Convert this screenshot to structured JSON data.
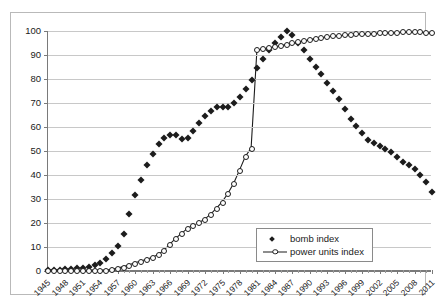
{
  "chart_data": {
    "type": "scatter",
    "title": "",
    "xlabel": "",
    "ylabel": "",
    "ylim": [
      0,
      100
    ],
    "ytick_step": 10,
    "yticks": [
      0,
      10,
      20,
      30,
      40,
      50,
      60,
      70,
      80,
      90,
      100
    ],
    "grid": true,
    "legend_position": "inside-bottom-right",
    "x": [
      1945,
      1946,
      1947,
      1948,
      1949,
      1950,
      1951,
      1952,
      1953,
      1954,
      1955,
      1956,
      1957,
      1958,
      1959,
      1960,
      1961,
      1962,
      1963,
      1964,
      1965,
      1966,
      1967,
      1968,
      1969,
      1970,
      1971,
      1972,
      1973,
      1974,
      1975,
      1976,
      1977,
      1978,
      1979,
      1980,
      1981,
      1982,
      1983,
      1984,
      1985,
      1986,
      1987,
      1988,
      1989,
      1990,
      1991,
      1992,
      1993,
      1994,
      1995,
      1996,
      1997,
      1998,
      1999,
      2000,
      2001,
      2002,
      2003,
      2004,
      2005,
      2006,
      2007,
      2008,
      2009,
      2010,
      2011
    ],
    "xtick_labels": [
      "1945",
      "1948",
      "1951",
      "1954",
      "1957",
      "1960",
      "1963",
      "1966",
      "1969",
      "1972",
      "1975",
      "1978",
      "1981",
      "1984",
      "1987",
      "1990",
      "1993",
      "1996",
      "1999",
      "2002",
      "2005",
      "2008",
      "2011"
    ],
    "series": [
      {
        "name": "bomb index",
        "marker": "filled-diamond",
        "color": "#1c1c1c",
        "line": false,
        "values": [
          0.4,
          0.5,
          0.6,
          0.7,
          0.9,
          1.1,
          1.4,
          1.8,
          2.6,
          3.4,
          5.0,
          7.5,
          10.6,
          15.5,
          23.8,
          31.8,
          38.0,
          44.3,
          48.8,
          52.8,
          55.5,
          56.8,
          56.8,
          55.0,
          55.5,
          58.3,
          61.7,
          64.5,
          66.8,
          68.3,
          68.5,
          68.3,
          70.2,
          72.5,
          76.0,
          79.6,
          84.5,
          88.4,
          92.0,
          95.0,
          97.5,
          100.0,
          98.5,
          95.0,
          92.0,
          88.5,
          85.0,
          82.0,
          78.5,
          75.0,
          71.5,
          67.5,
          63.5,
          60.5,
          57.5,
          54.5,
          53.5,
          52.0,
          51.0,
          49.5,
          47.5,
          45.5,
          44.0,
          42.3,
          40.0,
          37.0,
          33.0
        ]
      },
      {
        "name": "power units index",
        "marker": "open-circle",
        "color": "#1c1c1c",
        "line": true,
        "values": [
          0,
          0,
          0,
          0,
          0,
          0,
          0,
          0,
          0,
          0,
          0,
          0.3,
          0.8,
          1.4,
          2.2,
          3.0,
          3.8,
          4.5,
          5.3,
          6.5,
          8.3,
          10.8,
          13.2,
          15.3,
          17.3,
          18.8,
          19.8,
          21.3,
          23.3,
          25.8,
          28.5,
          32.0,
          36.3,
          41.8,
          47.5,
          51.0,
          92.0,
          92.5,
          93.0,
          93.3,
          93.8,
          94.3,
          94.8,
          95.3,
          95.8,
          96.3,
          96.8,
          97.2,
          97.5,
          97.8,
          98.0,
          98.2,
          98.4,
          98.6,
          98.7,
          98.8,
          98.9,
          99.0,
          99.1,
          99.2,
          99.3,
          99.4,
          99.4,
          99.5,
          99.5,
          99.3,
          99.0
        ]
      }
    ]
  },
  "legend": {
    "entries": [
      {
        "label": "bomb index"
      },
      {
        "label": "power units index"
      }
    ]
  }
}
